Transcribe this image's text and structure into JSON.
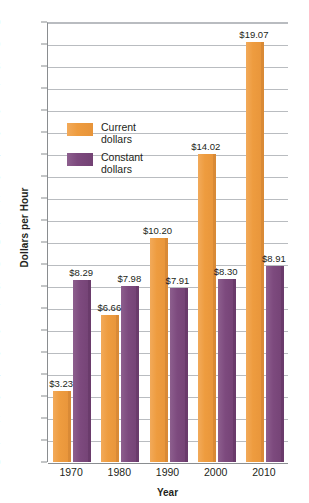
{
  "chart_data": {
    "type": "bar",
    "title": "",
    "xlabel": "Year",
    "ylabel": "Dollars per Hour",
    "categories": [
      "1970",
      "1980",
      "1990",
      "2000",
      "2010"
    ],
    "ylim": [
      0,
      20
    ],
    "y_tick_step": 1,
    "y_tick_labels": [
      "$0",
      "$1",
      "$2",
      "$3",
      "$4",
      "$5",
      "$6",
      "$7",
      "$8",
      "$9",
      "$10",
      "$11",
      "$12",
      "$13",
      "$14",
      "$15",
      "$16",
      "$17",
      "$18",
      "$19",
      "$20"
    ],
    "grid": true,
    "legend_position": "inside-upper-left",
    "series": [
      {
        "name": "Current dollars",
        "color": "#E7943A",
        "values": [
          3.23,
          6.66,
          10.2,
          14.02,
          19.07
        ],
        "labels": [
          "$3.23",
          "$6.66",
          "$10.20",
          "$14.02",
          "$19.07"
        ]
      },
      {
        "name": "Constant dollars",
        "color": "#7D4A7E",
        "values": [
          8.29,
          7.98,
          7.91,
          8.3,
          8.91
        ],
        "labels": [
          "$8.29",
          "$7.98",
          "$7.91",
          "$8.30",
          "$8.91"
        ]
      }
    ]
  },
  "axes": {
    "y_title": "Dollars per Hour",
    "x_title": "Year"
  },
  "legend": {
    "items": [
      {
        "label_line1": "Current",
        "label_line2": "dollars",
        "swatch": "current"
      },
      {
        "label_line1": "Constant",
        "label_line2": "dollars",
        "swatch": "constant"
      }
    ]
  },
  "colors": {
    "current": "#E7943A",
    "constant": "#7D4A7E",
    "gridline": "#B9BCC0",
    "axis": "#8A8D90",
    "text": "#231F20",
    "background": "#FFFFFF"
  }
}
